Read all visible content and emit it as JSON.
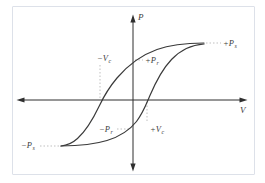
{
  "figure": {
    "axes": {
      "vertical_label": "P",
      "horizontal_label": "V"
    },
    "points": {
      "pos_ps": {
        "main": "+P",
        "sub": "s"
      },
      "neg_ps": {
        "main": "−P",
        "sub": "s"
      },
      "neg_vc": {
        "main": "−V",
        "sub": "c"
      },
      "pos_pr": {
        "main": "+P",
        "sub": "r"
      },
      "neg_pr": {
        "main": "−P",
        "sub": "r"
      },
      "pos_vc": {
        "main": "+V",
        "sub": "c"
      }
    },
    "colors": {
      "curve": "#3a3a3a",
      "axis": "#2f2f2f",
      "dotted_leader": "#aeaeae",
      "frame_border": "#dde1e9",
      "background": "#ffffff",
      "text": "#3b3b3b"
    }
  }
}
